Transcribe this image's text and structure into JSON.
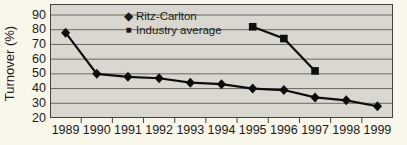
{
  "colors": {
    "page_bg": "#f9f6ec",
    "plot_bg": "#d9d7d0",
    "grid": "#6a6862",
    "border": "#45433e",
    "series": "#0d0d0c",
    "text": "#1c1b18"
  },
  "legend": {
    "diamond_glyph": "◆",
    "square_glyph": "■"
  },
  "chart_data": {
    "type": "line",
    "title": "",
    "xlabel": "",
    "ylabel": "Turnover (%)",
    "ylim": [
      20,
      90
    ],
    "yticks": [
      90,
      80,
      70,
      60,
      50,
      40,
      30,
      20
    ],
    "grid": true,
    "legend_position": "top-inside",
    "categories": [
      1989,
      1990,
      1991,
      1992,
      1993,
      1994,
      1995,
      1996,
      1997,
      1998,
      1999
    ],
    "series": [
      {
        "name": "Ritz-Carlton",
        "marker": "diamond",
        "values": [
          78,
          50,
          48,
          47,
          44,
          43,
          40,
          39,
          34,
          32,
          28
        ]
      },
      {
        "name": "Industry average",
        "marker": "square",
        "values": [
          null,
          null,
          null,
          null,
          null,
          null,
          82,
          74,
          52,
          null,
          null
        ]
      }
    ]
  }
}
